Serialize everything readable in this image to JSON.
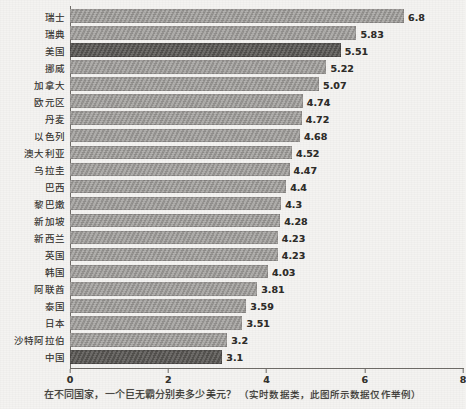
{
  "chart_data": {
    "type": "bar",
    "orientation": "horizontal",
    "title": "",
    "xlabel": "",
    "ylabel": "",
    "xlim": [
      0,
      8
    ],
    "xticks": [
      0,
      2,
      4,
      6,
      8
    ],
    "grid": false,
    "legend": null,
    "categories": [
      "瑞士",
      "瑞典",
      "美国",
      "挪威",
      "加拿大",
      "欧元区",
      "丹麦",
      "以色列",
      "澳大利亚",
      "乌拉圭",
      "巴西",
      "黎巴嫩",
      "新加坡",
      "新西兰",
      "英国",
      "韩国",
      "阿联酋",
      "泰国",
      "日本",
      "沙特阿拉伯",
      "中国"
    ],
    "values": [
      6.8,
      5.83,
      5.51,
      5.22,
      5.07,
      4.74,
      4.72,
      4.68,
      4.52,
      4.47,
      4.4,
      4.3,
      4.28,
      4.23,
      4.23,
      4.03,
      3.81,
      3.59,
      3.51,
      3.2,
      3.1
    ],
    "value_labels": [
      "6.8",
      "5.83",
      "5.51",
      "5.22",
      "5.07",
      "4.74",
      "4.72",
      "4.68",
      "4.52",
      "4.47",
      "4.4",
      "4.3",
      "4.28",
      "4.23",
      "4.23",
      "4.03",
      "3.81",
      "3.59",
      "3.51",
      "3.2",
      "3.1"
    ],
    "highlighted_categories": [
      "美国",
      "中国"
    ],
    "colors": {
      "bar": "#9c9a97",
      "bar_highlight": "#595754",
      "axis": "#6f6c68",
      "text": "#35332f",
      "background": "#f4f3f1"
    }
  },
  "caption": {
    "question": "在不同国家，一个巨无霸分别卖多少美元？",
    "note": "（实时数据类，此图所示数据仅作举例）"
  }
}
